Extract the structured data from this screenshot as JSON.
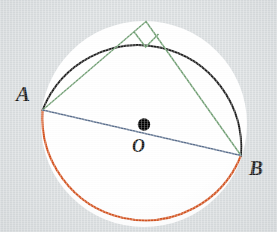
{
  "figure": {
    "background_color": "#dadee0",
    "circle_fill": "#ffffff"
  },
  "labels": {
    "point_a": "A",
    "point_b": "B",
    "center_o": "O"
  },
  "colors": {
    "arc_upper": "#1c1c1c",
    "arc_lower": "#d4521e",
    "diameter": "#5a6e8c",
    "triangle": "#6f9e72",
    "center_dot": "#000000",
    "page": "#dadee0",
    "disk": "#ffffff"
  },
  "geometry": {
    "circle": {
      "cx": 144,
      "cy": 124,
      "r": 103
    },
    "points": {
      "A": {
        "x": 42,
        "y": 110,
        "label": "A"
      },
      "B": {
        "x": 241,
        "y": 155,
        "label": "B"
      },
      "C": {
        "x": 146,
        "y": 21,
        "label": ""
      },
      "O": {
        "x": 144,
        "y": 124,
        "label": "O"
      }
    },
    "segments": [
      {
        "name": "diameter-AB",
        "from": "A",
        "to": "B",
        "color": "#5a6e8c",
        "width": 1.4
      },
      {
        "name": "chord-AC",
        "from": "A",
        "to": "C",
        "color": "#6f9e72",
        "width": 1.4
      },
      {
        "name": "chord-CB",
        "from": "C",
        "to": "B",
        "color": "#6f9e72",
        "width": 1.4
      }
    ],
    "right_angle_marker": {
      "at": "C",
      "size": 20,
      "color": "#6f9e72",
      "description": "square marker indicating 90 degree angle at apex C"
    },
    "arcs": [
      {
        "name": "arc-upper-black",
        "from": "A",
        "to": "B",
        "direction": "clockwise-over-top",
        "color": "#1c1c1c",
        "width": 2.0
      },
      {
        "name": "arc-lower-orange",
        "from": "A",
        "to": "B",
        "direction": "counterclockwise-under-bottom",
        "color": "#d4521e",
        "width": 2.0
      }
    ],
    "center_dot_radius": 6
  }
}
